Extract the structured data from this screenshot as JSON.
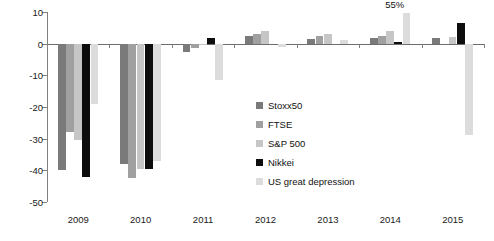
{
  "chart_data": {
    "type": "bar",
    "title": "",
    "subtitle": "",
    "xlabel": "",
    "ylabel": "",
    "categories": [
      "2009",
      "2010",
      "2011",
      "2012",
      "2013",
      "2014",
      "2015"
    ],
    "ylim": [
      -50,
      10
    ],
    "yticks": [
      10,
      0,
      -10,
      -20,
      -30,
      -40,
      -50
    ],
    "ytick_labels": [
      "10",
      "0",
      "-10",
      "-20",
      "-30",
      "-40",
      "-50"
    ],
    "grid": false,
    "legend_position": "center-left-inside",
    "series": [
      {
        "name": "Stoxx50",
        "color": "#7a7a7a",
        "values": [
          -40.0,
          -38.0,
          -2.6,
          2.4,
          1.6,
          1.9,
          1.7
        ]
      },
      {
        "name": "FTSE",
        "color": "#a0a0a0",
        "values": [
          -28.0,
          -42.5,
          -1.4,
          3.0,
          2.4,
          2.4,
          0.0
        ]
      },
      {
        "name": "S&P 500",
        "color": "#c6c6c6",
        "values": [
          -30.5,
          -39.5,
          -0.3,
          3.9,
          3.2,
          4.0,
          2.2
        ]
      },
      {
        "name": "Nikkei",
        "color": "#0d0d0d",
        "values": [
          -42.0,
          -39.5,
          1.8,
          0.0,
          0.0,
          0.4,
          6.4
        ]
      },
      {
        "name": "US great depression",
        "color": "#dcdcdc",
        "values": [
          -19.0,
          -37.0,
          -11.6,
          -1.0,
          1.2,
          9.8,
          -29.0
        ]
      }
    ],
    "annotations": [
      {
        "text": "55%",
        "series": "US great depression",
        "category": "2014"
      }
    ]
  },
  "legend": {
    "items": [
      {
        "label": "Stoxx50",
        "color": "#7a7a7a"
      },
      {
        "label": "FTSE",
        "color": "#a0a0a0"
      },
      {
        "label": "S&P 500",
        "color": "#c6c6c6"
      },
      {
        "label": "Nikkei",
        "color": "#0d0d0d"
      },
      {
        "label": "US great depression",
        "color": "#dcdcdc"
      }
    ]
  }
}
